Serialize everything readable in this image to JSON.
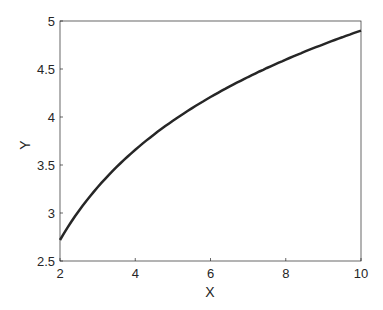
{
  "chart_data": {
    "type": "line",
    "title": "",
    "xlabel": "X",
    "ylabel": "Y",
    "xlim": [
      2,
      10
    ],
    "ylim": [
      2.5,
      5
    ],
    "xticks": [
      "2",
      "4",
      "6",
      "8",
      "10"
    ],
    "yticks": [
      "2.5",
      "3",
      "3.5",
      "4",
      "4.5",
      "5"
    ],
    "grid": false,
    "legend": null,
    "series": [
      {
        "name": "curve",
        "color": "#262626",
        "x": [
          2,
          3,
          4,
          5,
          6,
          7,
          8,
          9,
          10
        ],
        "y": [
          2.72,
          3.27,
          3.66,
          3.96,
          4.21,
          4.42,
          4.6,
          4.76,
          4.9
        ]
      }
    ]
  }
}
